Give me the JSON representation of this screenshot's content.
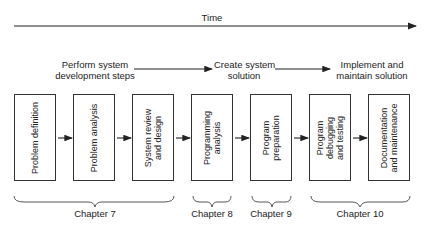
{
  "timeline": {
    "label": "Time"
  },
  "phases": [
    {
      "label_line1": "Perform system",
      "label_line2": "development steps"
    },
    {
      "label_line1": "Create system",
      "label_line2": "solution"
    },
    {
      "label_line1": "Implement and",
      "label_line2": "maintain solution"
    }
  ],
  "steps": [
    {
      "line1": "Problem definition",
      "line2": ""
    },
    {
      "line1": "Problem analysis",
      "line2": ""
    },
    {
      "line1": "System review",
      "line2": "and design"
    },
    {
      "line1": "Programming",
      "line2": "analysis"
    },
    {
      "line1": "Program",
      "line2": "preparation"
    },
    {
      "line1": "Program",
      "line2": "debugging",
      "line3": "and testing"
    },
    {
      "line1": "Documentation",
      "line2": "and maintenance"
    }
  ],
  "chapters": [
    {
      "label": "Chapter 7"
    },
    {
      "label": "Chapter 8"
    },
    {
      "label": "Chapter 9"
    },
    {
      "label": "Chapter 10"
    }
  ]
}
